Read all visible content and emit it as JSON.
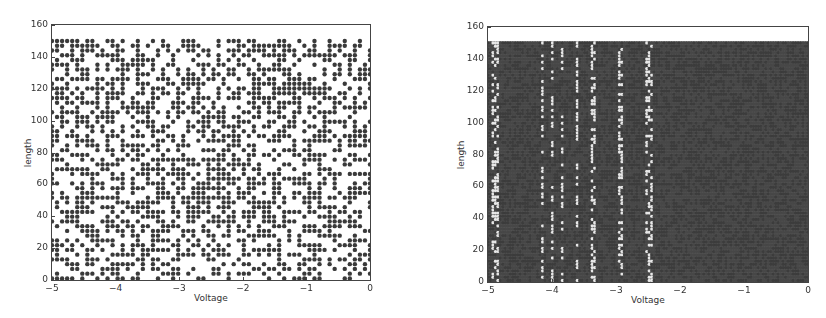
{
  "chart_data": [
    {
      "type": "scatter",
      "title": "",
      "xlabel": "Voltage",
      "ylabel": "length",
      "xlim": [
        -5,
        0
      ],
      "ylim": [
        0,
        160
      ],
      "xticks": [
        "-5",
        "-4",
        "-3",
        "-2",
        "-1",
        "0"
      ],
      "yticks": [
        "0",
        "20",
        "40",
        "60",
        "80",
        "100",
        "120",
        "140",
        "160"
      ],
      "grid": false,
      "legend": null,
      "description": "Sparse random scatter of sampled (Voltage, length) points on a regular grid covering Voltage -5..0 and length 0..150",
      "point_color": "#3a3a3a",
      "grid_cols": 64,
      "grid_rows": 51,
      "fill_fraction": 0.5,
      "seed": 7
    },
    {
      "type": "scatter",
      "title": "",
      "xlabel": "Voltage",
      "ylabel": "length",
      "xlim": [
        -5,
        0
      ],
      "ylim": [
        0,
        160
      ],
      "xticks": [
        "-5",
        "-4",
        "-3",
        "-2",
        "-1",
        "0"
      ],
      "yticks": [
        "0",
        "20",
        "40",
        "60",
        "80",
        "100",
        "120",
        "140",
        "160"
      ],
      "grid": false,
      "legend": null,
      "description": "Dense full grid of (Voltage, length) points filling Voltage -5..0 and length 0..150; a few columns have missing (white) points",
      "point_color": "#3c3c3c",
      "grid_cols": 130,
      "grid_rows": 75,
      "fill_fraction": 1.0,
      "gap_columns_voltage": [
        -4.9,
        -4.85,
        -4.15,
        -4.0,
        -3.85,
        -3.6,
        -3.35,
        -2.95,
        -2.9,
        -2.5,
        -2.45
      ],
      "seed": 11
    }
  ]
}
